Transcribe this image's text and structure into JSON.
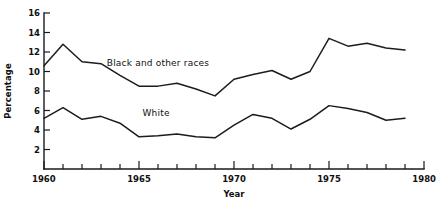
{
  "chart_data": {
    "type": "line",
    "title": "",
    "xlabel": "Year",
    "ylabel": "Percentage",
    "xlim": [
      1960,
      1980
    ],
    "ylim": [
      0,
      16
    ],
    "grid": false,
    "legend_position": "inline-annotations",
    "x_ticks_major": [
      1960,
      1965,
      1970,
      1975,
      1980
    ],
    "x_tick_labels": [
      "1960",
      "1965",
      "1970",
      "1975",
      "1980"
    ],
    "x_ticks_minor_step": 1,
    "y_ticks": [
      2,
      4,
      6,
      8,
      10,
      12,
      14,
      16
    ],
    "y_tick_labels": [
      "2",
      "4",
      "6",
      "8",
      "10",
      "12",
      "14",
      "16"
    ],
    "x": [
      1960,
      1961,
      1962,
      1963,
      1964,
      1965,
      1966,
      1967,
      1968,
      1969,
      1970,
      1971,
      1972,
      1973,
      1974,
      1975,
      1976,
      1977,
      1978,
      1979
    ],
    "series": [
      {
        "name": "Black and other races",
        "label_x": 1966.0,
        "label_y": 10.6,
        "values": [
          10.6,
          12.8,
          11.0,
          10.8,
          9.6,
          8.5,
          8.5,
          8.8,
          8.2,
          7.5,
          9.2,
          9.7,
          10.1,
          9.2,
          10.0,
          13.4,
          12.6,
          12.9,
          12.4,
          12.2
        ]
      },
      {
        "name": "White",
        "label_x": 1965.9,
        "label_y": 5.4,
        "values": [
          5.2,
          6.3,
          5.1,
          5.4,
          4.7,
          3.3,
          3.4,
          3.6,
          3.3,
          3.2,
          4.5,
          5.6,
          5.2,
          4.1,
          5.1,
          6.5,
          6.2,
          5.8,
          5.0,
          5.2
        ]
      }
    ]
  },
  "axes": {
    "y_axis_title": "Percentage",
    "x_axis_title": "Year"
  }
}
